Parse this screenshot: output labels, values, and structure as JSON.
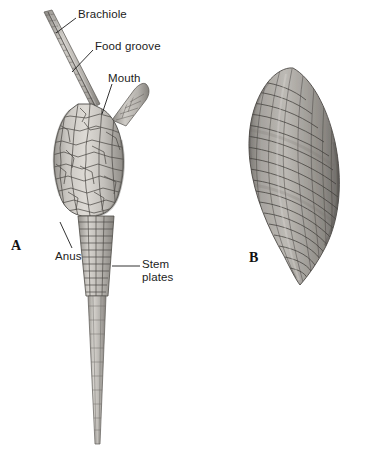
{
  "figure": {
    "background_color": "#ffffff",
    "ink_color": "#1c1c1c",
    "plate_fill_light": "#d8d6d2",
    "plate_fill_mid": "#b9b6b1",
    "plate_fill_dark": "#8e8b87",
    "plate_outline": "#4a4845",
    "panels": [
      {
        "letter": "A",
        "subject": "eocrinoid-whole-body-reconstruction",
        "description": "Reconstruction of a stalked eocrinoid showing brachiole, food groove, mouth, anus, plated theca and tapering columnal stem"
      },
      {
        "letter": "B",
        "subject": "blastoid-thecal-specimen-photograph",
        "description": "Elongate ovate thecal specimen with spiral rows of rectangular plates, pointed apex and base"
      }
    ],
    "labels": [
      {
        "id": "brachiole",
        "text": "Brachiole"
      },
      {
        "id": "foodgroove",
        "text": "Food groove"
      },
      {
        "id": "mouth",
        "text": "Mouth"
      },
      {
        "id": "anus",
        "text": "Anus"
      },
      {
        "id": "stemplates",
        "text": "Stem\nplates",
        "line1": "Stem",
        "line2": "plates"
      }
    ],
    "panel_letters": {
      "a": "A",
      "b": "B"
    }
  }
}
